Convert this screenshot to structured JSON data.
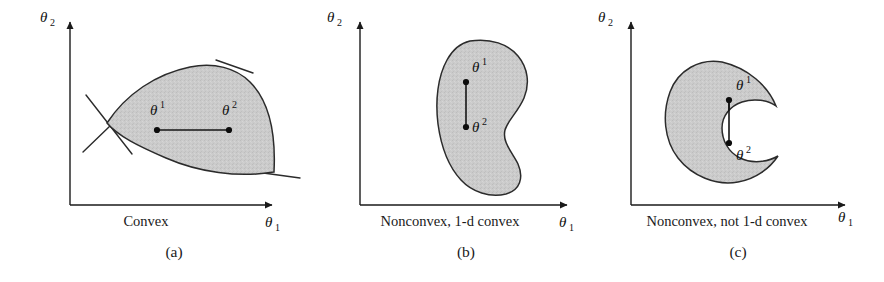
{
  "figure": {
    "kind": "three-panel line drawing of convex and nonconvex parameter sets",
    "background_color": "#ffffff",
    "region_fill_color": "#c8c8c8",
    "region_outline_color": "#2b2b2b",
    "axis_color": "#1a1a1a"
  },
  "panels": [
    {
      "id": "a",
      "letter": "(a)",
      "caption": "Convex",
      "y_axis_label": "θ",
      "y_axis_sub": "2",
      "x_axis_label": "θ",
      "x_axis_sub": "1",
      "point1_label": "θ",
      "point1_sup": "1",
      "point2_label": "θ",
      "point2_sup": "2",
      "shape": "lens / leaf shaped convex region with three supporting tangent lines",
      "chord_inside": "yes"
    },
    {
      "id": "b",
      "letter": "(b)",
      "caption": "Nonconvex, 1-d convex",
      "y_axis_label": "θ",
      "y_axis_sub": "2",
      "x_axis_label": "θ",
      "x_axis_sub": "1",
      "point1_label": "θ",
      "point1_sup": "1",
      "point2_label": "θ",
      "point2_sup": "2",
      "shape": "kidney / bean shaped region with a shallow concave notch on the right side",
      "chord_inside": "yes"
    },
    {
      "id": "c",
      "letter": "(c)",
      "caption": "Nonconvex, not 1-d convex",
      "y_axis_label": "θ",
      "y_axis_sub": "2",
      "x_axis_label": "θ",
      "x_axis_sub": "1",
      "point1_label": "θ",
      "point1_sup": "1",
      "point2_label": "θ",
      "point2_sup": "2",
      "shape": "crescent / C shaped region opening to the right",
      "chord_inside": "no"
    }
  ]
}
